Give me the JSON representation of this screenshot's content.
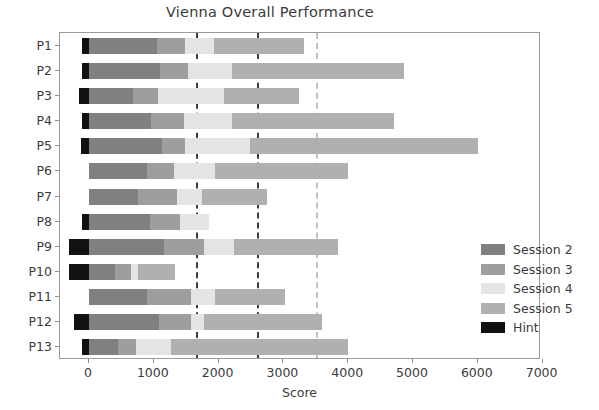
{
  "chart_data": {
    "type": "bar",
    "orientation": "horizontal",
    "stacked": true,
    "title": "Vienna Overall Performance",
    "xlabel": "Score",
    "ylabel": "",
    "xlim": [
      -400,
      7600
    ],
    "xticks": [
      0,
      1000,
      2000,
      3000,
      4000,
      5000,
      6000,
      7000
    ],
    "xticklabels": [
      "0",
      "1000",
      "2000",
      "3000",
      "4000",
      "5000",
      "6000",
      "7000"
    ],
    "categories": [
      "P1",
      "P2",
      "P3",
      "P4",
      "P5",
      "P6",
      "P7",
      "P8",
      "P9",
      "P10",
      "P11",
      "P12",
      "P13"
    ],
    "grid": false,
    "legend_position": "right",
    "series": [
      {
        "name": "Session 2",
        "color": "#808080",
        "values": [
          1050,
          1100,
          680,
          960,
          1130,
          890,
          760,
          940,
          1160,
          400,
          900,
          1080,
          440
        ]
      },
      {
        "name": "Session 3",
        "color": "#9e9e9e",
        "values": [
          430,
          430,
          380,
          500,
          350,
          420,
          600,
          470,
          620,
          250,
          680,
          500,
          280
        ]
      },
      {
        "name": "Session 4",
        "color": "#e4e4e4",
        "values": [
          450,
          680,
          1030,
          750,
          1000,
          640,
          380,
          440,
          460,
          100,
          360,
          200,
          540
        ]
      },
      {
        "name": "Session 5",
        "color": "#b0b0b0",
        "values": [
          1390,
          2650,
          1150,
          2490,
          3520,
          2050,
          1000,
          0,
          1600,
          580,
          1080,
          1820,
          2740
        ]
      },
      {
        "name": "Hint",
        "color": "#111111",
        "values": [
          -110,
          -110,
          -150,
          -110,
          -120,
          0,
          0,
          -110,
          -310,
          -310,
          0,
          -230,
          -110
        ]
      }
    ],
    "vlines": [
      {
        "value": 1650,
        "color": "#3d3d3d",
        "style": "dashed"
      },
      {
        "value": 2600,
        "color": "#3d3d3d",
        "style": "dashed"
      },
      {
        "value": 3500,
        "color": "#c2c2c2",
        "style": "dashed"
      }
    ],
    "bar_totals": [
      3320,
      4860,
      3240,
      4700,
      6000,
      4000,
      2740,
      1850,
      3840,
      1330,
      3020,
      3600,
      4000
    ]
  },
  "legend": {
    "items": [
      {
        "label": "Session 2",
        "color": "#808080"
      },
      {
        "label": "Session 3",
        "color": "#9e9e9e"
      },
      {
        "label": "Session 4",
        "color": "#e4e4e4"
      },
      {
        "label": "Session 5",
        "color": "#b0b0b0"
      },
      {
        "label": "Hint",
        "color": "#111111"
      }
    ]
  }
}
